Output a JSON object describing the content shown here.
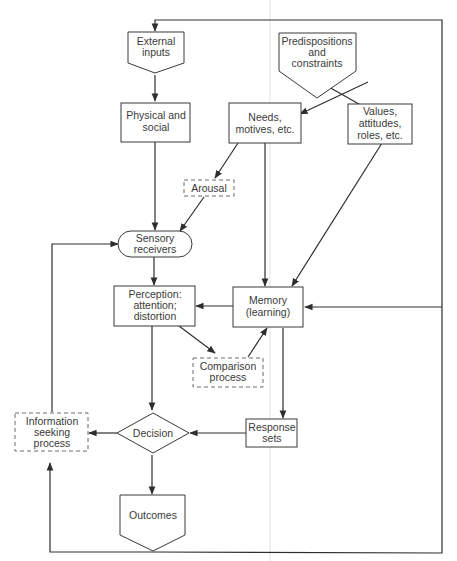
{
  "diagram": {
    "nodes": {
      "external_inputs": {
        "lines": [
          "External",
          "inputs"
        ],
        "shape": "pentagon-down"
      },
      "predispositions": {
        "lines": [
          "Predispositions",
          "and",
          "constraints"
        ],
        "shape": "pentagon-down"
      },
      "physical_social": {
        "lines": [
          "Physical and",
          "social"
        ],
        "shape": "rectangle"
      },
      "needs_motives": {
        "lines": [
          "Needs,",
          "motives, etc."
        ],
        "shape": "rectangle"
      },
      "values_attitudes": {
        "lines": [
          "Values,",
          "attitudes,",
          "roles, etc."
        ],
        "shape": "rectangle"
      },
      "arousal": {
        "lines": [
          "Arousal"
        ],
        "shape": "dashed-rectangle"
      },
      "sensory_receivers": {
        "lines": [
          "Sensory",
          "receivers"
        ],
        "shape": "rounded"
      },
      "perception": {
        "lines": [
          "Perception:",
          "attention;",
          "distortion"
        ],
        "shape": "rectangle"
      },
      "memory": {
        "lines": [
          "Memory",
          "(learning)"
        ],
        "shape": "rectangle"
      },
      "comparison": {
        "lines": [
          "Comparison",
          "process"
        ],
        "shape": "dashed-rectangle"
      },
      "info_seeking": {
        "lines": [
          "Information",
          "seeking",
          "process"
        ],
        "shape": "dashed-rectangle"
      },
      "decision": {
        "lines": [
          "Decision"
        ],
        "shape": "diamond"
      },
      "response_sets": {
        "lines": [
          "Response",
          "sets"
        ],
        "shape": "rectangle"
      },
      "outcomes": {
        "lines": [
          "Outcomes"
        ],
        "shape": "pentagon-down"
      }
    },
    "edges": [
      [
        "external_inputs",
        "physical_social"
      ],
      [
        "predispositions",
        "needs_motives"
      ],
      [
        "predispositions",
        "values_attitudes"
      ],
      [
        "physical_social",
        "sensory_receivers"
      ],
      [
        "needs_motives",
        "arousal"
      ],
      [
        "arousal",
        "sensory_receivers"
      ],
      [
        "needs_motives",
        "memory"
      ],
      [
        "values_attitudes",
        "memory"
      ],
      [
        "sensory_receivers",
        "perception"
      ],
      [
        "memory",
        "perception"
      ],
      [
        "perception",
        "comparison"
      ],
      [
        "comparison",
        "memory"
      ],
      [
        "perception",
        "decision"
      ],
      [
        "memory",
        "response_sets"
      ],
      [
        "response_sets",
        "decision"
      ],
      [
        "decision",
        "info_seeking"
      ],
      [
        "info_seeking",
        "sensory_receivers"
      ],
      [
        "decision",
        "outcomes"
      ],
      [
        "outcomes",
        "info_seeking"
      ],
      [
        "outcomes",
        "external_inputs"
      ],
      [
        "outcomes",
        "memory"
      ]
    ],
    "colors": {
      "stroke": "#3a3a3a",
      "text": "#3a3a3a",
      "background": "#ffffff"
    }
  }
}
